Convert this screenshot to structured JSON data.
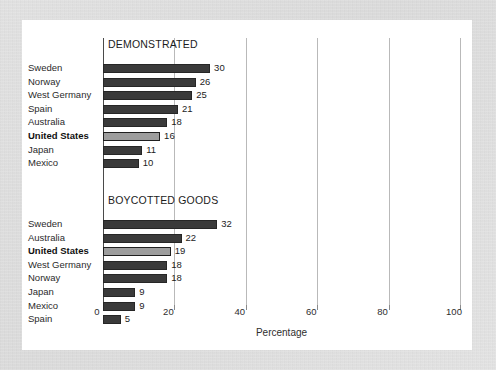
{
  "chart_data": {
    "type": "bar",
    "title": "",
    "xlabel": "Percentage",
    "ylabel": "",
    "xlim": [
      0,
      100
    ],
    "xticks": [
      0,
      20,
      40,
      60,
      80,
      100
    ],
    "grid": true,
    "legend": null,
    "orientation": "horizontal",
    "highlight_category": "United States",
    "panels": [
      {
        "title": "DEMONSTRATED",
        "categories": [
          "Sweden",
          "Norway",
          "West Germany",
          "Spain",
          "Australia",
          "United States",
          "Japan",
          "Mexico"
        ],
        "values": [
          30,
          26,
          25,
          21,
          18,
          16,
          11,
          10
        ]
      },
      {
        "title": "BOYCOTTED GOODS",
        "categories": [
          "Sweden",
          "Australia",
          "United States",
          "West Germany",
          "Norway",
          "Japan",
          "Mexico",
          "Spain"
        ],
        "values": [
          32,
          22,
          19,
          18,
          18,
          9,
          9,
          5
        ]
      }
    ]
  },
  "colors": {
    "bar": "#3a3a3a",
    "bar_highlight": "#9d9d9d",
    "grid": "#b9b9b9",
    "axis": "#4a4a4a",
    "card_background": "#ffffff",
    "page_background": "#d9d9d9"
  }
}
